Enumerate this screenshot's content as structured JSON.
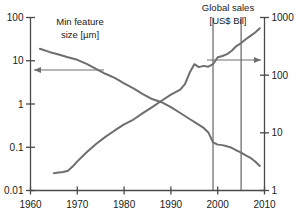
{
  "chart_data": {
    "type": "line",
    "title": "",
    "xlabel": "",
    "grid": false,
    "legend_position": "inline-annotations",
    "x": {
      "label": "",
      "ticks": [
        "1960",
        "1970",
        "1980",
        "1990",
        "2000",
        "2010"
      ],
      "tickvals": [
        1960,
        1970,
        1980,
        1990,
        2000,
        2010
      ],
      "lim": [
        1960,
        2010
      ],
      "scale": "linear"
    },
    "yleft": {
      "label": "Min feature size [µm]",
      "ticks": [
        "100",
        "10",
        "1",
        "0.1",
        "0.01"
      ],
      "tickvals": [
        100,
        10,
        1,
        0.1,
        0.01
      ],
      "lim": [
        0.01,
        100
      ],
      "scale": "log"
    },
    "yright": {
      "label": "Global sales [US$ Bil]",
      "ticks": [
        "1000",
        "100",
        "10",
        "1"
      ],
      "tickvals": [
        1000,
        100,
        10,
        1
      ],
      "lim": [
        1,
        1000
      ],
      "scale": "log"
    },
    "series": [
      {
        "name": "Min feature size [µm]",
        "axis": "left",
        "unit": "µm",
        "color": "#6e6e6e",
        "x": [
          1962,
          1964,
          1966,
          1968,
          1970,
          1972,
          1974,
          1976,
          1978,
          1980,
          1982,
          1984,
          1986,
          1988,
          1990,
          1992,
          1994,
          1996,
          1997,
          1998,
          1999,
          2000,
          2001,
          2002,
          2003,
          2004,
          2005,
          2006,
          2007,
          2008,
          2009
        ],
        "values": [
          19,
          16,
          14,
          12,
          10.5,
          8.5,
          6.5,
          5.0,
          4.0,
          3.0,
          2.3,
          1.7,
          1.3,
          1.1,
          0.85,
          0.62,
          0.45,
          0.33,
          0.28,
          0.22,
          0.13,
          0.115,
          0.112,
          0.105,
          0.097,
          0.085,
          0.075,
          0.065,
          0.057,
          0.047,
          0.037
        ]
      },
      {
        "name": "Global sales [US$ Bil]",
        "axis": "right",
        "unit": "US$ Bil",
        "color": "#6e6e6e",
        "x": [
          1965,
          1966,
          1967,
          1968,
          1969,
          1970,
          1972,
          1974,
          1976,
          1978,
          1980,
          1982,
          1984,
          1986,
          1988,
          1990,
          1992,
          1993,
          1994,
          1995,
          1996,
          1997,
          1998,
          1999,
          2000,
          2001,
          2002,
          2003,
          2004,
          2005,
          2006,
          2007,
          2008,
          2009
        ],
        "values": [
          2.0,
          2.05,
          2.1,
          2.2,
          2.6,
          3.2,
          4.6,
          6.4,
          8.5,
          11,
          14,
          17,
          22,
          28,
          36,
          46,
          56,
          70,
          110,
          155,
          138,
          145,
          140,
          155,
          205,
          215,
          232,
          265,
          320,
          360,
          420,
          480,
          550,
          650
        ]
      }
    ],
    "annotations": [
      {
        "name": "left-axis-label",
        "text_lines": [
          "Min feature",
          "size [µm]"
        ],
        "x_px": 80,
        "y_px": 22
      },
      {
        "name": "right-axis-label",
        "text_lines": [
          "Global sales",
          "[US$ Bil]"
        ],
        "x_px": 228,
        "y_px": 8
      },
      {
        "name": "left-pointer-arrow",
        "direction": "left",
        "from_px": [
          104,
          70
        ],
        "to_px": [
          34,
          70
        ]
      },
      {
        "name": "right-pointer-arrow",
        "direction": "right",
        "from_px": [
          207,
          60
        ],
        "to_px": [
          261,
          60
        ]
      },
      {
        "name": "vertical-marker-1",
        "x_value": 1999
      },
      {
        "name": "vertical-marker-2",
        "x_value": 2005
      }
    ],
    "colors": {
      "axis": "#4a4a4a",
      "curve": "#6e6e6e",
      "marker_line": "#555555",
      "arrow": "#6e6e6e",
      "text": "#1a1a1a",
      "background": "#ffffff"
    }
  },
  "labels": {
    "left_title_line1": "Min feature",
    "left_title_line2": "size [µm]",
    "right_title_line1": "Global sales",
    "right_title_line2": "[US$ Bil]",
    "yleft_ticks": [
      "100",
      "10",
      "1",
      "0.1",
      "0.01"
    ],
    "yright_ticks": [
      "1000",
      "100",
      "10",
      "1"
    ],
    "x_ticks": [
      "1960",
      "1970",
      "1980",
      "1990",
      "2000",
      "2010"
    ]
  }
}
